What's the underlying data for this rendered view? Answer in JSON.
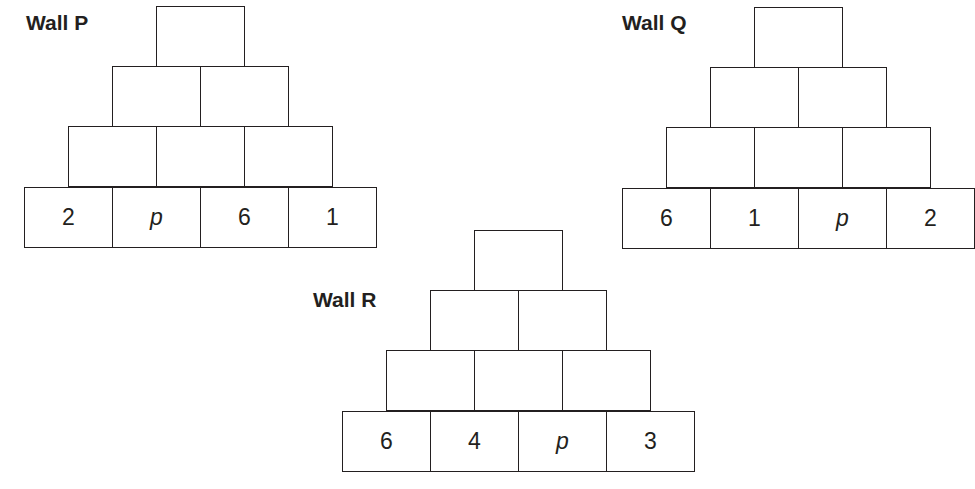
{
  "walls": [
    {
      "label": "Wall P",
      "rows": [
        [
          ""
        ],
        [
          "",
          ""
        ],
        [
          "",
          "",
          ""
        ],
        [
          "2",
          "p",
          "6",
          "1"
        ]
      ]
    },
    {
      "label": "Wall Q",
      "rows": [
        [
          ""
        ],
        [
          "",
          ""
        ],
        [
          "",
          "",
          ""
        ],
        [
          "6",
          "1",
          "p",
          "2"
        ]
      ]
    },
    {
      "label": "Wall R",
      "rows": [
        [
          ""
        ],
        [
          "",
          ""
        ],
        [
          "",
          "",
          ""
        ],
        [
          "6",
          "4",
          "p",
          "3"
        ]
      ]
    }
  ],
  "colors": {
    "line": "#231f20",
    "background": "#ffffff"
  }
}
